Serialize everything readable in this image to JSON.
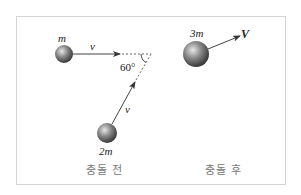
{
  "diagram": {
    "type": "collision",
    "before": {
      "caption": "충돌 전",
      "objects": [
        {
          "label": "m",
          "velocity_label": "v",
          "direction": "right"
        },
        {
          "label": "2m",
          "velocity_label": "v",
          "direction": "up-right"
        }
      ],
      "angle_label": "60°"
    },
    "after": {
      "caption": "충돌 후",
      "objects": [
        {
          "label": "3m",
          "velocity_label": "V",
          "direction": "up-right"
        }
      ]
    }
  }
}
